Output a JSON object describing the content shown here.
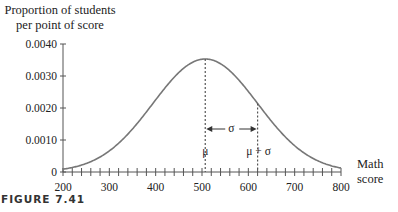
{
  "chart_data": {
    "type": "line",
    "title": "",
    "ylabel_line1": "Proportion of students",
    "ylabel_line2": "per point of score",
    "xlabel_line1": "Math",
    "xlabel_line2": "score",
    "caption": "FIGURE 7.41",
    "xlim": [
      200,
      800
    ],
    "ylim": [
      0,
      0.004
    ],
    "x_ticks": [
      200,
      300,
      400,
      500,
      600,
      700,
      800
    ],
    "x_tick_labels": [
      "200",
      "300",
      "400",
      "500",
      "600",
      "700",
      "800"
    ],
    "x_minor_tick_step": 20,
    "y_ticks": [
      0,
      0.001,
      0.002,
      0.003,
      0.004
    ],
    "y_tick_labels": [
      "0",
      "0.0010",
      "0.0020",
      "0.0030",
      "0.0040"
    ],
    "grid": false,
    "legend": null,
    "series": [
      {
        "name": "Normal density of math scores",
        "distribution": "normal",
        "mu": 507,
        "sigma": 113,
        "peak_value": 0.00353,
        "color": "#777777"
      }
    ],
    "annotations": {
      "mu_label": "μ",
      "mu_sigma_label": "μ + σ",
      "sigma_label": "σ",
      "mu_x": 507,
      "mu_plus_sigma_x": 620
    }
  }
}
